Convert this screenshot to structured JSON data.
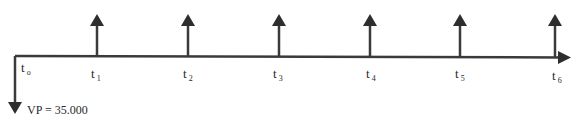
{
  "diagram": {
    "type": "cash-flow-timeline",
    "line_color": "#3a3a3a",
    "periods": [
      {
        "label": "t",
        "sub": "o"
      },
      {
        "label": "t",
        "sub": "1"
      },
      {
        "label": "t",
        "sub": "2"
      },
      {
        "label": "t",
        "sub": "3"
      },
      {
        "label": "t",
        "sub": "4"
      },
      {
        "label": "t",
        "sub": "5"
      },
      {
        "label": "t",
        "sub": "6"
      }
    ],
    "outflow_label": "VP = 35.000",
    "inflow_count": 6
  }
}
